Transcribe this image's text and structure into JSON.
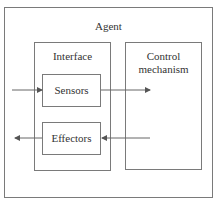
{
  "diagram": {
    "outer": {
      "label": "Agent"
    },
    "interface": {
      "label": "Interface"
    },
    "sensors": {
      "label": "Sensors"
    },
    "effectors": {
      "label": "Effectors"
    },
    "control": {
      "label": "Control mechanism",
      "line1": "Control",
      "line2": "mechanism"
    },
    "arrows": [
      {
        "from": "environment",
        "to": "sensors"
      },
      {
        "from": "sensors",
        "to": "control"
      },
      {
        "from": "control",
        "to": "effectors"
      },
      {
        "from": "effectors",
        "to": "environment"
      }
    ],
    "colors": {
      "line": "#7a7a7a",
      "text": "#333333"
    }
  }
}
